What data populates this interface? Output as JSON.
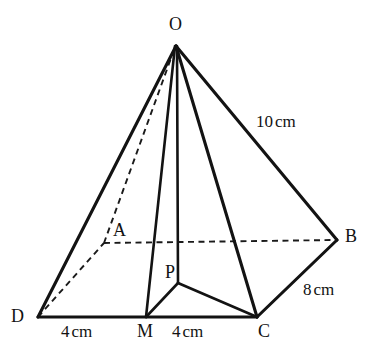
{
  "figure": {
    "background_color": "#ffffff",
    "line_color": "#131313",
    "hidden_line_color": "#1a1a1a"
  },
  "vertices": [
    {
      "id": "O",
      "label": "O",
      "x": 176,
      "y": 44,
      "kind": "apex",
      "hidden": false
    },
    {
      "id": "A",
      "label": "A",
      "x": 104,
      "y": 243,
      "kind": "base",
      "hidden": true
    },
    {
      "id": "B",
      "label": "B",
      "x": 337,
      "y": 240,
      "kind": "base",
      "hidden": false
    },
    {
      "id": "C",
      "label": "C",
      "x": 257,
      "y": 317,
      "kind": "base",
      "hidden": false
    },
    {
      "id": "D",
      "label": "D",
      "x": 38,
      "y": 317,
      "kind": "base",
      "hidden": false
    },
    {
      "id": "M",
      "label": "M",
      "x": 146,
      "y": 317,
      "kind": "midpoint",
      "hidden": false
    },
    {
      "id": "P",
      "label": "P",
      "x": 178,
      "y": 283,
      "kind": "centre",
      "hidden": false
    }
  ],
  "edges": [
    {
      "from": "O",
      "to": "D",
      "style": "solid"
    },
    {
      "from": "O",
      "to": "B",
      "style": "solid"
    },
    {
      "from": "O",
      "to": "C",
      "style": "solid"
    },
    {
      "from": "O",
      "to": "M",
      "style": "solid"
    },
    {
      "from": "O",
      "to": "P",
      "style": "solid"
    },
    {
      "from": "O",
      "to": "A",
      "style": "dashed"
    },
    {
      "from": "D",
      "to": "C",
      "style": "solid"
    },
    {
      "from": "C",
      "to": "B",
      "style": "solid"
    },
    {
      "from": "D",
      "to": "A",
      "style": "dashed"
    },
    {
      "from": "A",
      "to": "B",
      "style": "dashed"
    },
    {
      "from": "P",
      "to": "M",
      "style": "solid"
    },
    {
      "from": "P",
      "to": "C",
      "style": "solid"
    }
  ],
  "measurements": {
    "slant_edge": {
      "value": "10",
      "unit": "cm",
      "applies_to": "OB"
    },
    "base_side": {
      "value": "8",
      "unit": "cm",
      "applies_to": "CB"
    },
    "base_half_left": {
      "value": "4",
      "unit": "cm",
      "applies_to": "DM"
    },
    "base_half_right": {
      "value": "4",
      "unit": "cm",
      "applies_to": "MC"
    }
  },
  "labels": {
    "O": "O",
    "A": "A",
    "B": "B",
    "C": "C",
    "D": "D",
    "M": "M",
    "P": "P",
    "slant": "10",
    "slant_unit": "cm",
    "side": "8",
    "side_unit": "cm",
    "base_left": "4",
    "base_left_unit": "cm",
    "base_right": "4",
    "base_right_unit": "cm"
  }
}
